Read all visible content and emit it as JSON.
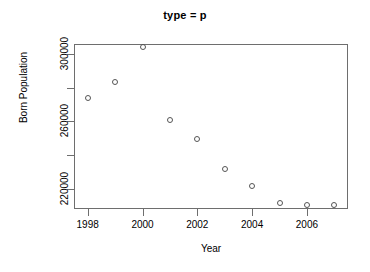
{
  "chart_data": {
    "type": "scatter",
    "title": "type = p",
    "xlabel": "Year",
    "ylabel": "Born Population",
    "x": [
      1998,
      1999,
      2000,
      2001,
      2002,
      2003,
      2004,
      2005,
      2006,
      2007
    ],
    "values": [
      274000,
      283500,
      304000,
      261000,
      249500,
      231500,
      221500,
      211500,
      210500,
      210500
    ],
    "series": [
      {
        "name": "Born Population",
        "values": [
          274000,
          283500,
          304000,
          261000,
          249500,
          231500,
          221500,
          211500,
          210500,
          210500
        ]
      }
    ],
    "points": [
      {
        "x": 1998,
        "y": 274000
      },
      {
        "x": 1999,
        "y": 283500
      },
      {
        "x": 2000,
        "y": 304000
      },
      {
        "x": 2001,
        "y": 261000
      },
      {
        "x": 2002,
        "y": 249500
      },
      {
        "x": 2003,
        "y": 231500
      },
      {
        "x": 2004,
        "y": 221500
      },
      {
        "x": 2005,
        "y": 211500
      },
      {
        "x": 2006,
        "y": 210500
      },
      {
        "x": 2007,
        "y": 210500
      }
    ],
    "xlim": [
      1997.5,
      2007.5
    ],
    "ylim": [
      208000,
      306000
    ],
    "xticks": [
      1998,
      2000,
      2002,
      2004,
      2006
    ],
    "xtick_labels": [
      "1998",
      "2000",
      "2002",
      "2004",
      "2006"
    ],
    "yticks": [
      220000,
      240000,
      260000,
      280000,
      300000
    ],
    "ytick_labels": [
      "220000",
      "",
      "260000",
      "",
      "300000"
    ],
    "ytick_labels_visible": [
      "300000",
      "260000",
      "220000"
    ],
    "grid": false,
    "legend": null,
    "marker": "open-circle",
    "marker_color": "#555555",
    "frame_color": "#6e6e6e",
    "background": "#ffffff"
  }
}
